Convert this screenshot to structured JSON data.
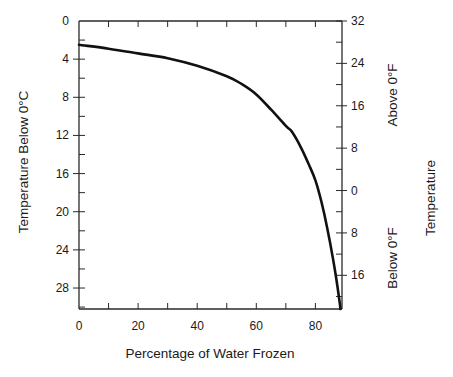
{
  "chart_data": {
    "type": "line",
    "title": "",
    "xlabel": "Percentage of Water Frozen",
    "ylabel": "Temperature Below 0°C",
    "y2label_main": "Temperature",
    "y2label_upper": "Above 0°F",
    "y2label_lower": "Below 0°F",
    "xlim": [
      0,
      89
    ],
    "ylim": [
      0,
      30.2
    ],
    "y_inverted": true,
    "grid": false,
    "x_ticks": [
      0,
      20,
      40,
      60,
      80
    ],
    "x_tick_labels": [
      "0",
      "20",
      "40",
      "60",
      "80"
    ],
    "x_minor_step": 10,
    "y_ticks": [
      0,
      4,
      8,
      12,
      16,
      20,
      24,
      28
    ],
    "y_tick_labels": [
      "0",
      "4",
      "8",
      "12",
      "16",
      "20",
      "24",
      "28"
    ],
    "y_minor_step": 2,
    "y2_ticks_fahrenheit": [
      32,
      24,
      16,
      8,
      0,
      -8,
      -16
    ],
    "y2_tick_labels": [
      "32",
      "24",
      "16",
      "8",
      "0",
      "8",
      "16"
    ],
    "series": [
      {
        "name": "Freezing curve",
        "x": [
          0,
          10,
          20,
          30,
          40,
          50,
          55,
          60,
          65,
          70,
          72,
          75,
          78,
          80,
          82,
          84,
          86,
          87,
          88,
          88.5
        ],
        "y": [
          2.5,
          2.9,
          3.4,
          3.9,
          4.7,
          5.8,
          6.6,
          7.7,
          9.3,
          11.0,
          11.6,
          13.2,
          15.2,
          16.7,
          18.9,
          21.7,
          25.0,
          26.9,
          29.0,
          30.2
        ]
      }
    ]
  }
}
